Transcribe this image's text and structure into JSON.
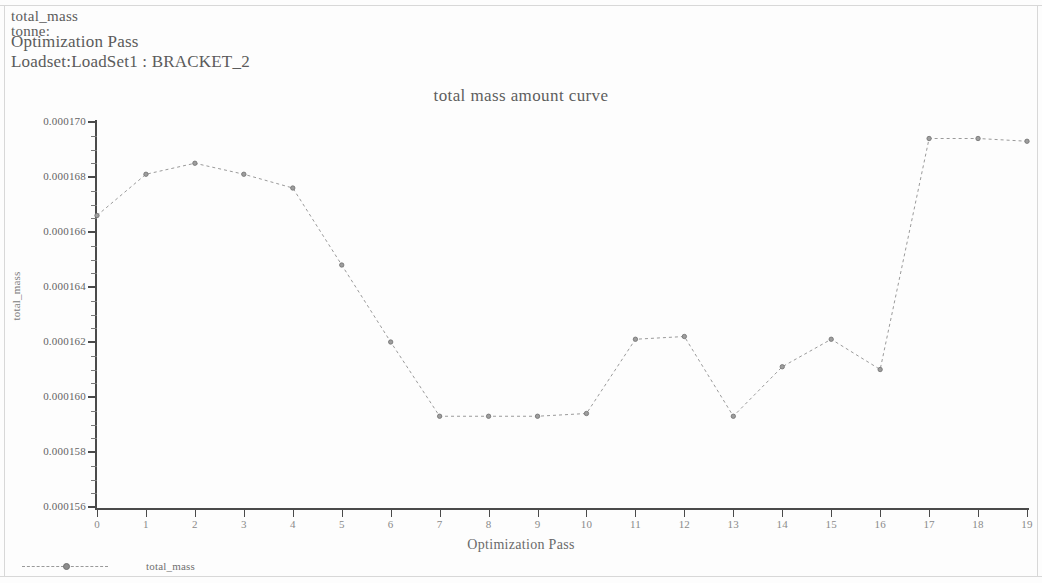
{
  "header": {
    "line1": "total_mass",
    "line2": "tonne:",
    "line3": "Optimization Pass",
    "line4": "Loadset:LoadSet1 :  BRACKET_2"
  },
  "legend": {
    "label": "total_mass",
    "marker": "dashed-line-with-circle-marker"
  },
  "colors": {
    "axis": "#4a4a4a",
    "series": "#9a9a9a",
    "marker": "#707070",
    "text": "#646464",
    "background": "#fdfdfd"
  },
  "chart_data": {
    "type": "line",
    "title": "total mass amount curve",
    "xlabel": "Optimization Pass",
    "ylabel": "total_mass",
    "x": [
      0,
      1,
      2,
      3,
      4,
      5,
      6,
      7,
      8,
      9,
      10,
      11,
      12,
      13,
      14,
      15,
      16,
      17,
      18,
      19
    ],
    "xtick_labels": [
      "0",
      "1",
      "2",
      "3",
      "4",
      "5",
      "6",
      "7",
      "8",
      "9",
      "10",
      "11",
      "12",
      "13",
      "14",
      "15",
      "16",
      "17",
      "18",
      "19"
    ],
    "xlim": [
      0,
      19
    ],
    "ytick_labels": [
      "0.000170",
      "0.000168",
      "0.000166",
      "0.000164",
      "0.000162",
      "0.000160",
      "0.000158",
      "0.000156"
    ],
    "ytick_values": [
      0.00017,
      0.000168,
      0.000166,
      0.000164,
      0.000162,
      0.00016,
      0.000158,
      0.000156
    ],
    "ylim": [
      0.000156,
      0.00017
    ],
    "grid": false,
    "legend_position": "bottom-left",
    "series": [
      {
        "name": "total_mass",
        "marker": "circle",
        "linestyle": "dashed",
        "values": [
          0.0001666,
          0.0001681,
          0.0001685,
          0.0001681,
          0.0001676,
          0.0001648,
          0.000162,
          0.0001593,
          0.0001593,
          0.0001593,
          0.0001594,
          0.0001621,
          0.0001622,
          0.0001593,
          0.0001611,
          0.0001621,
          0.000161,
          0.0001694,
          0.0001694,
          0.0001693
        ]
      }
    ]
  }
}
